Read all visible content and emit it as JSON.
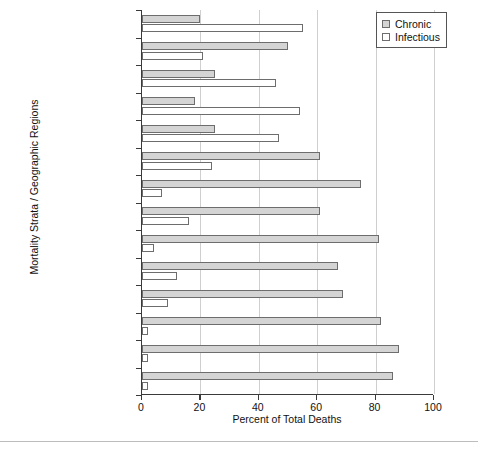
{
  "chart_data": {
    "type": "bar",
    "orientation": "horizontal",
    "title": "",
    "xlabel": "Percent of Total Deaths",
    "ylabel": "Mortality Strata / Geographic Regions",
    "xlim": [
      0,
      100
    ],
    "xticks": [
      0,
      20,
      40,
      60,
      80,
      100
    ],
    "xticklabels": [
      "0",
      "20",
      "40",
      "60",
      "80",
      "100"
    ],
    "grid": "vertical",
    "legend_position": "top-right",
    "categories": [
      "(E) Africa",
      "(D) Southeast Asia",
      "(D) E. Mediterranean",
      "(D) America",
      "(D) Africa",
      "(C) Europe",
      "(B) W. Pacific",
      "(B) Southeast Asia",
      "(B) Europe",
      "(B) E. Mediterranean",
      "(B) America",
      "(B) W. Pacific",
      "(A) Europe",
      "(A) America"
    ],
    "series": [
      {
        "name": "Chronic",
        "color": "#d4d4d4",
        "values": [
          20,
          50,
          25,
          18,
          25,
          61,
          75,
          61,
          81,
          67,
          69,
          82,
          88,
          86
        ]
      },
      {
        "name": "Infectious",
        "color": "#ffffff",
        "values": [
          55,
          21,
          46,
          54,
          47,
          24,
          7,
          16,
          4,
          12,
          9,
          2,
          2,
          2
        ]
      }
    ]
  },
  "legend": {
    "items": [
      {
        "label": "Chronic",
        "swatch": "chronic"
      },
      {
        "label": "Infectious",
        "swatch": "infectious"
      }
    ]
  },
  "axes": {
    "x_title": "Percent of Total Deaths",
    "y_title": "Mortality Strata / Geographic Regions"
  }
}
